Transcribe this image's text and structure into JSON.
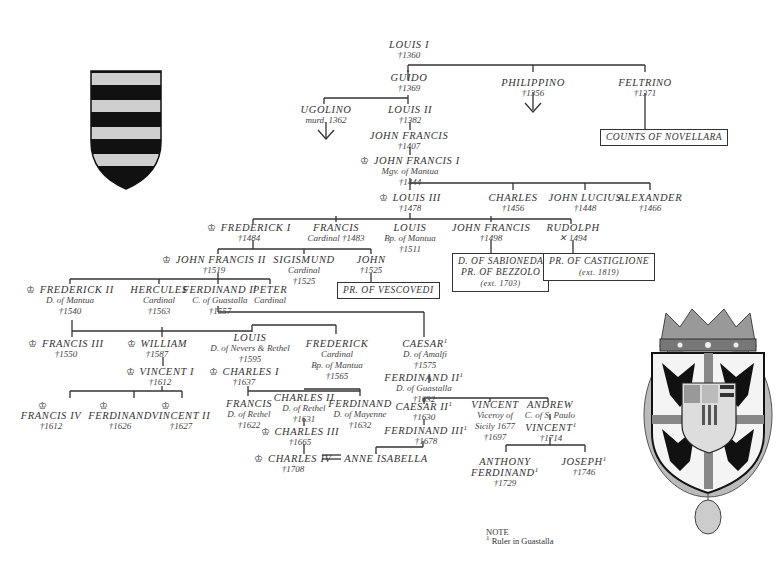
{
  "diagram": {
    "type": "family-tree",
    "title_partial": "Gonzaga family tree (header cut off)",
    "marker_legend": {
      "crown": "ruler (Marquis/Duke of Mantua)",
      "cross": "killed in battle",
      "double_line": "married"
    },
    "note": {
      "heading": "NOTE",
      "text": "Ruler in Guastalla",
      "marker": "1"
    },
    "heraldry": {
      "left": "gonzaga-early-arms-shield",
      "right": "ducal-arms-with-crown-and-collar"
    },
    "nodes": {
      "louis1": {
        "name": "LOUIS I",
        "sub": [
          "†1360"
        ]
      },
      "guido": {
        "name": "GUIDO",
        "sub": [
          "†1369"
        ]
      },
      "philippino": {
        "name": "PHILIPPINO",
        "sub": [
          "†1356"
        ]
      },
      "feltrino": {
        "name": "FELTRINO",
        "sub": [
          "†1371"
        ]
      },
      "ugolino": {
        "name": "UGOLINO",
        "sub": [
          "murd. 1362"
        ]
      },
      "louis2": {
        "name": "LOUIS II",
        "sub": [
          "†1382"
        ]
      },
      "johnfrancis_a": {
        "name": "JOHN FRANCIS",
        "sub": [
          "†1407"
        ]
      },
      "johnfrancis1": {
        "name": "JOHN FRANCIS I",
        "sub": [
          "Mgv. of Mantua",
          "†1444"
        ]
      },
      "louis3": {
        "name": "LOUIS III",
        "sub": [
          "†1478"
        ]
      },
      "charles_a": {
        "name": "CHARLES",
        "sub": [
          "†1456"
        ]
      },
      "johnlucius": {
        "name": "JOHN LUCIUS",
        "sub": [
          "†1448"
        ]
      },
      "alexander": {
        "name": "ALEXANDER",
        "sub": [
          "†1466"
        ]
      },
      "frederick1": {
        "name": "FREDERICK I",
        "sub": [
          "†1484"
        ]
      },
      "francis_card": {
        "name": "FRANCIS",
        "sub": [
          "Cardinal †1483"
        ]
      },
      "louis_bp": {
        "name": "LOUIS",
        "sub": [
          "Bp. of Mantua",
          "†1511"
        ]
      },
      "johnfrancis_b": {
        "name": "JOHN FRANCIS",
        "sub": [
          "†1498"
        ]
      },
      "rudolph": {
        "name": "RUDOLPH",
        "sub": [
          "✕ 1494"
        ]
      },
      "johnfrancis2": {
        "name": "JOHN FRANCIS II",
        "sub": [
          "†1519"
        ]
      },
      "sigismund": {
        "name": "SIGISMUND",
        "sub": [
          "Cardinal",
          "†1525"
        ]
      },
      "john": {
        "name": "JOHN",
        "sub": [
          "†1525"
        ]
      },
      "frederick2": {
        "name": "FREDERICK II",
        "sub": [
          "D. of Mantua",
          "†1540"
        ]
      },
      "hercules": {
        "name": "HERCULES",
        "sub": [
          "Cardinal",
          "†1563"
        ]
      },
      "ferdinand1": {
        "name": "FERDINAND I",
        "sup": "1",
        "sub": [
          "C. of Guastalla",
          "†1557"
        ]
      },
      "peter": {
        "name": "PETER",
        "sub": [
          "Cardinal"
        ]
      },
      "francis3": {
        "name": "FRANCIS III",
        "sub": [
          "†1550"
        ]
      },
      "william": {
        "name": "WILLIAM",
        "sub": [
          "†1587"
        ]
      },
      "louis_nevers": {
        "name": "LOUIS",
        "sub": [
          "D. of Nevers & Rethel",
          "†1595"
        ]
      },
      "frederick_card": {
        "name": "FREDERICK",
        "sub": [
          "Cardinal",
          "Bp. of Mantua",
          "†1565"
        ]
      },
      "caesar1": {
        "name": "CAESAR",
        "sup": "1",
        "sub": [
          "D. of Amalfi",
          "†1575"
        ]
      },
      "ferdinand2": {
        "name": "FERDINAND II",
        "sup": "1",
        "sub": [
          "D. of Guastalla",
          "†1632"
        ]
      },
      "vincent1": {
        "name": "VINCENT I",
        "sub": [
          "†1612"
        ]
      },
      "charles1": {
        "name": "CHARLES I",
        "sub": [
          "†1637"
        ]
      },
      "francis4": {
        "name": "FRANCIS IV",
        "sub": [
          "†1612"
        ]
      },
      "ferdinand_m": {
        "name": "FERDINAND",
        "sub": [
          "†1626"
        ]
      },
      "vincent2": {
        "name": "VINCENT II",
        "sub": [
          "†1627"
        ]
      },
      "francis_rethel": {
        "name": "FRANCIS",
        "sub": [
          "D. of Rethel",
          "†1622"
        ]
      },
      "charles2": {
        "name": "CHARLES II",
        "sub": [
          "D. of Rethel",
          "†1631"
        ]
      },
      "ferdinand_mayenne": {
        "name": "FERDINAND",
        "sub": [
          "D. of Mayenne",
          "†1632"
        ]
      },
      "charles3": {
        "name": "CHARLES III",
        "sub": [
          "†1665"
        ]
      },
      "charles4": {
        "name": "CHARLES IV",
        "sub": [
          "†1708"
        ]
      },
      "anne_isabella": {
        "name": "ANNE ISABELLA",
        "sub": []
      },
      "caesar2": {
        "name": "CAESAR II",
        "sup": "1",
        "sub": [
          "†1630"
        ]
      },
      "ferdinand3": {
        "name": "FERDINAND III",
        "sup": "1",
        "sub": [
          "†1678"
        ]
      },
      "vincent_viceroy": {
        "name": "VINCENT",
        "sub": [
          "Viceroy of",
          "Sicily 1677",
          "†1697"
        ]
      },
      "andrew": {
        "name": "ANDREW",
        "sub": [
          "C. of S. Paulo"
        ]
      },
      "vincent_g": {
        "name": "VINCENT",
        "sup": "1",
        "sub": [
          "†1714"
        ]
      },
      "anthony_ferdinand": {
        "name": "ANTHONY",
        "name2": "FERDINAND",
        "sup": "1",
        "sub": [
          "†1729"
        ]
      },
      "joseph": {
        "name": "JOSEPH",
        "sup": "1",
        "sub": [
          "†1746"
        ]
      }
    },
    "boxes": {
      "novellara": {
        "label": "COUNTS OF NOVELLARA"
      },
      "vescovedi": {
        "label": "PR. OF VESCOVEDI"
      },
      "sabioneda": {
        "label": "D. OF SABIONEDA",
        "label2": "PR. OF BEZZOLO",
        "ext": "(ext. 1703)"
      },
      "castiglione": {
        "label": "PR. OF CASTIGLIONE",
        "ext": "(ext. 1819)"
      }
    }
  }
}
